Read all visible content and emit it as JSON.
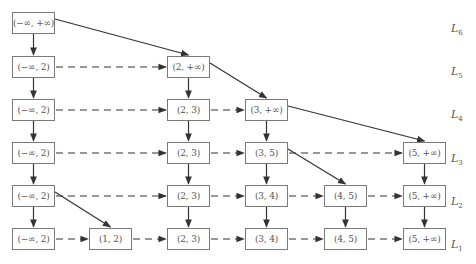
{
  "diagram": {
    "levels": [
      {
        "id": "L6",
        "label": "L",
        "sub": "6",
        "y": 22
      },
      {
        "id": "L5",
        "label": "L",
        "sub": "5",
        "y": 65
      },
      {
        "id": "L4",
        "label": "L",
        "sub": "4",
        "y": 108
      },
      {
        "id": "L3",
        "label": "L",
        "sub": "3",
        "y": 152
      },
      {
        "id": "L2",
        "label": "L",
        "sub": "2",
        "y": 195
      },
      {
        "id": "L1",
        "label": "L",
        "sub": "1",
        "y": 238
      }
    ],
    "nodes": [
      {
        "id": "n6_0",
        "level": "L6",
        "col": 0,
        "text": "(−∞, +∞)"
      },
      {
        "id": "n5_0",
        "level": "L5",
        "col": 0,
        "text": "(−∞, 2)"
      },
      {
        "id": "n5_2",
        "level": "L5",
        "col": 2,
        "text": "(2, +∞)"
      },
      {
        "id": "n4_0",
        "level": "L4",
        "col": 0,
        "text": "(−∞, 2)"
      },
      {
        "id": "n4_2",
        "level": "L4",
        "col": 2,
        "text": "(2, 3)"
      },
      {
        "id": "n4_3",
        "level": "L4",
        "col": 3,
        "text": "(3, +∞)"
      },
      {
        "id": "n3_0",
        "level": "L3",
        "col": 0,
        "text": "(−∞, 2)"
      },
      {
        "id": "n3_2",
        "level": "L3",
        "col": 2,
        "text": "(2, 3)"
      },
      {
        "id": "n3_3",
        "level": "L3",
        "col": 3,
        "text": "(3, 5)"
      },
      {
        "id": "n3_5",
        "level": "L3",
        "col": 5,
        "text": "(5, +∞)"
      },
      {
        "id": "n2_0",
        "level": "L2",
        "col": 0,
        "text": "(−∞, 2)"
      },
      {
        "id": "n2_2",
        "level": "L2",
        "col": 2,
        "text": "(2, 3)"
      },
      {
        "id": "n2_3",
        "level": "L2",
        "col": 3,
        "text": "(3, 4)"
      },
      {
        "id": "n2_4",
        "level": "L2",
        "col": 4,
        "text": "(4, 5)"
      },
      {
        "id": "n2_5",
        "level": "L2",
        "col": 5,
        "text": "(5, +∞)"
      },
      {
        "id": "n1_0",
        "level": "L1",
        "col": 0,
        "text": "(−∞, 2)"
      },
      {
        "id": "n1_1",
        "level": "L1",
        "col": 1,
        "text": "(1, 2)"
      },
      {
        "id": "n1_2",
        "level": "L1",
        "col": 2,
        "text": "(2, 3)"
      },
      {
        "id": "n1_3",
        "level": "L1",
        "col": 3,
        "text": "(3, 4)"
      },
      {
        "id": "n1_4",
        "level": "L1",
        "col": 4,
        "text": "(4, 5)"
      },
      {
        "id": "n1_5",
        "level": "L1",
        "col": 5,
        "text": "(5, +∞)"
      }
    ],
    "edges": {
      "down": [
        [
          "n6_0",
          "n5_0"
        ],
        [
          "n5_0",
          "n4_0"
        ],
        [
          "n4_0",
          "n3_0"
        ],
        [
          "n3_0",
          "n2_0"
        ],
        [
          "n2_0",
          "n1_0"
        ],
        [
          "n5_2",
          "n4_2"
        ],
        [
          "n4_2",
          "n3_2"
        ],
        [
          "n3_2",
          "n2_2"
        ],
        [
          "n2_2",
          "n1_2"
        ],
        [
          "n4_3",
          "n3_3"
        ],
        [
          "n3_3",
          "n2_3"
        ],
        [
          "n2_3",
          "n1_3"
        ],
        [
          "n2_4",
          "n1_4"
        ],
        [
          "n3_5",
          "n2_5"
        ],
        [
          "n2_5",
          "n1_5"
        ]
      ],
      "diagonal": [
        [
          "n6_0",
          "n5_2"
        ],
        [
          "n5_2",
          "n4_3"
        ],
        [
          "n4_3",
          "n3_5"
        ],
        [
          "n3_3",
          "n2_4"
        ],
        [
          "n2_0",
          "n1_1"
        ]
      ],
      "dashed": [
        [
          "n5_0",
          "n5_2"
        ],
        [
          "n4_0",
          "n4_2"
        ],
        [
          "n4_2",
          "n4_3"
        ],
        [
          "n3_0",
          "n3_2"
        ],
        [
          "n3_2",
          "n3_3"
        ],
        [
          "n3_3",
          "n3_5"
        ],
        [
          "n2_0",
          "n2_2"
        ],
        [
          "n2_2",
          "n2_3"
        ],
        [
          "n2_3",
          "n2_4"
        ],
        [
          "n2_4",
          "n2_5"
        ],
        [
          "n1_0",
          "n1_1"
        ],
        [
          "n1_1",
          "n1_2"
        ],
        [
          "n1_2",
          "n1_3"
        ],
        [
          "n1_3",
          "n1_4"
        ],
        [
          "n1_4",
          "n1_5"
        ]
      ]
    }
  },
  "style": {
    "line_color": "#333333",
    "box_border": "#7a7a7a",
    "text_color": "#555555"
  }
}
